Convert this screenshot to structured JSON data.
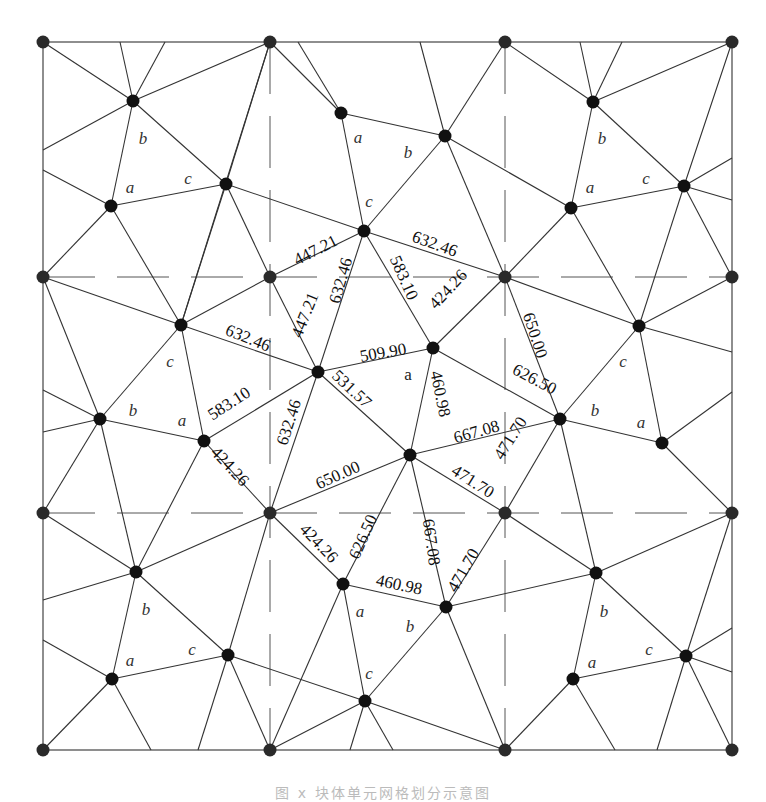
{
  "figure": {
    "caption": "图 x  块体单元网格划分示意图",
    "grid": {
      "xs": [
        43,
        270,
        505,
        732
      ],
      "ys": [
        42,
        277,
        513,
        750
      ]
    },
    "colors": {
      "line": "#333333",
      "node": "#111111",
      "background": "#ffffff"
    }
  },
  "chart_data": {
    "type": "diagram",
    "nodes": [
      {
        "id": "g00",
        "x": 43,
        "y": 42
      },
      {
        "id": "g10",
        "x": 270,
        "y": 42
      },
      {
        "id": "g20",
        "x": 505,
        "y": 42
      },
      {
        "id": "g30",
        "x": 732,
        "y": 42
      },
      {
        "id": "g01",
        "x": 43,
        "y": 277
      },
      {
        "id": "g11",
        "x": 270,
        "y": 277
      },
      {
        "id": "g21",
        "x": 505,
        "y": 277
      },
      {
        "id": "g31",
        "x": 732,
        "y": 277
      },
      {
        "id": "g02",
        "x": 43,
        "y": 513
      },
      {
        "id": "g12",
        "x": 270,
        "y": 513
      },
      {
        "id": "g22",
        "x": 505,
        "y": 513
      },
      {
        "id": "g32",
        "x": 732,
        "y": 513
      },
      {
        "id": "g03",
        "x": 43,
        "y": 750
      },
      {
        "id": "g13",
        "x": 270,
        "y": 750
      },
      {
        "id": "g23",
        "x": 505,
        "y": 750
      },
      {
        "id": "g33",
        "x": 732,
        "y": 750
      },
      {
        "id": "A1",
        "x": 133,
        "y": 101
      },
      {
        "id": "A2",
        "x": 111,
        "y": 206
      },
      {
        "id": "A3",
        "x": 226,
        "y": 184
      },
      {
        "id": "B1",
        "x": 341,
        "y": 113
      },
      {
        "id": "B2",
        "x": 445,
        "y": 136
      },
      {
        "id": "B3",
        "x": 364,
        "y": 231
      },
      {
        "id": "C1",
        "x": 593,
        "y": 102
      },
      {
        "id": "C2",
        "x": 571,
        "y": 208
      },
      {
        "id": "C3",
        "x": 684,
        "y": 186
      },
      {
        "id": "D1",
        "x": 181,
        "y": 325
      },
      {
        "id": "D2",
        "x": 100,
        "y": 419
      },
      {
        "id": "D3",
        "x": 204,
        "y": 441
      },
      {
        "id": "E",
        "x": 318,
        "y": 372
      },
      {
        "id": "F",
        "x": 433,
        "y": 348
      },
      {
        "id": "G",
        "x": 410,
        "y": 455
      },
      {
        "id": "H1",
        "x": 639,
        "y": 326
      },
      {
        "id": "H2",
        "x": 560,
        "y": 419
      },
      {
        "id": "H3",
        "x": 662,
        "y": 443
      },
      {
        "id": "I1",
        "x": 136,
        "y": 572
      },
      {
        "id": "I2",
        "x": 112,
        "y": 679
      },
      {
        "id": "I3",
        "x": 228,
        "y": 655
      },
      {
        "id": "J1",
        "x": 343,
        "y": 584
      },
      {
        "id": "J2",
        "x": 446,
        "y": 607
      },
      {
        "id": "J3",
        "x": 365,
        "y": 701
      },
      {
        "id": "K1",
        "x": 596,
        "y": 573
      },
      {
        "id": "K2",
        "x": 573,
        "y": 679
      },
      {
        "id": "K3",
        "x": 686,
        "y": 656
      }
    ],
    "edges": [
      [
        "g00",
        "A1"
      ],
      [
        "A1",
        "g10"
      ],
      [
        "A1",
        "A2"
      ],
      [
        "A1",
        "A3"
      ],
      [
        "A1",
        [
          43,
          150
        ]
      ],
      [
        "A1",
        [
          120,
          42
        ]
      ],
      [
        "A1",
        [
          165,
          42
        ]
      ],
      [
        "A2",
        "A3"
      ],
      [
        "A2",
        [
          43,
          170
        ]
      ],
      [
        "A2",
        "g01"
      ],
      [
        "A2",
        "D1"
      ],
      [
        "A3",
        "g10"
      ],
      [
        "A3",
        "B3"
      ],
      [
        "A3",
        "D1"
      ],
      [
        "A3",
        "g11"
      ],
      [
        "g10",
        "B1"
      ],
      [
        "g10",
        "D1"
      ],
      [
        "B1",
        "B2"
      ],
      [
        "B1",
        "B3"
      ],
      [
        "B1",
        [
          298,
          42
        ]
      ],
      [
        "B2",
        [
          420,
          42
        ]
      ],
      [
        "B2",
        "g20"
      ],
      [
        "B2",
        "B3"
      ],
      [
        "B2",
        "C2"
      ],
      [
        "B2",
        "g21"
      ],
      [
        "B3",
        "g11"
      ],
      [
        "B3",
        "g21"
      ],
      [
        "B3",
        "F"
      ],
      [
        "B3",
        "E"
      ],
      [
        "g20",
        "C1"
      ],
      [
        "C1",
        "g30"
      ],
      [
        "C1",
        "C2"
      ],
      [
        "C1",
        "C3"
      ],
      [
        "C1",
        [
          580,
          42
        ]
      ],
      [
        "C1",
        [
          622,
          42
        ]
      ],
      [
        "C2",
        "C3"
      ],
      [
        "C2",
        "g21"
      ],
      [
        "C2",
        "H1"
      ],
      [
        "C3",
        "g30"
      ],
      [
        "C3",
        [
          732,
          158
        ]
      ],
      [
        "C3",
        [
          732,
          200
        ]
      ],
      [
        "C3",
        "g31"
      ],
      [
        "C3",
        "H1"
      ],
      [
        "g01",
        "D1"
      ],
      [
        "g01",
        "D2"
      ],
      [
        "D1",
        "D2"
      ],
      [
        "D1",
        "g11"
      ],
      [
        "D1",
        "E"
      ],
      [
        "D1",
        "D3"
      ],
      [
        "D2",
        [
          43,
          390
        ]
      ],
      [
        "D2",
        [
          43,
          432
        ]
      ],
      [
        "D2",
        "D3"
      ],
      [
        "D2",
        "g02"
      ],
      [
        "D2",
        "I1"
      ],
      [
        "D3",
        "E"
      ],
      [
        "D3",
        "g12"
      ],
      [
        "D3",
        "I1"
      ],
      [
        "g11",
        "E"
      ],
      [
        "E",
        "F"
      ],
      [
        "E",
        "G"
      ],
      [
        "E",
        "g12"
      ],
      [
        "F",
        "g21"
      ],
      [
        "F",
        "G"
      ],
      [
        "F",
        "H2"
      ],
      [
        "G",
        "H2"
      ],
      [
        "G",
        "g12"
      ],
      [
        "G",
        "J1"
      ],
      [
        "G",
        "J2"
      ],
      [
        "G",
        "g22"
      ],
      [
        "g21",
        "H2"
      ],
      [
        "g21",
        "H1"
      ],
      [
        "g31",
        "H1"
      ],
      [
        "H1",
        "H2"
      ],
      [
        "H1",
        "H3"
      ],
      [
        "H1",
        [
          732,
          352
        ]
      ],
      [
        "H2",
        "H3"
      ],
      [
        "H2",
        "g22"
      ],
      [
        "H2",
        "K1"
      ],
      [
        "H3",
        [
          732,
          392
        ]
      ],
      [
        "H3",
        "g32"
      ],
      [
        "g02",
        "I1"
      ],
      [
        "I1",
        "I2"
      ],
      [
        "I1",
        "I3"
      ],
      [
        "I1",
        "g12"
      ],
      [
        "I1",
        [
          43,
          600
        ]
      ],
      [
        "I2",
        [
          43,
          640
        ]
      ],
      [
        "I2",
        "I3"
      ],
      [
        "I2",
        "g03"
      ],
      [
        "I2",
        [
          151,
          750
        ]
      ],
      [
        "I3",
        "g12"
      ],
      [
        "I3",
        "J3"
      ],
      [
        "I3",
        "g13"
      ],
      [
        "I3",
        [
          198,
          750
        ]
      ],
      [
        "g12",
        "J1"
      ],
      [
        "J1",
        "J2"
      ],
      [
        "J1",
        "J3"
      ],
      [
        "J1",
        "g13"
      ],
      [
        "J2",
        "g22"
      ],
      [
        "J2",
        "K1"
      ],
      [
        "J2",
        "J3"
      ],
      [
        "J2",
        "g23"
      ],
      [
        "J3",
        "g13"
      ],
      [
        "J3",
        "g23"
      ],
      [
        "J3",
        [
          350,
          750
        ]
      ],
      [
        "J3",
        [
          393,
          750
        ]
      ],
      [
        "g22",
        "K1"
      ],
      [
        "K1",
        "g32"
      ],
      [
        "K1",
        "K2"
      ],
      [
        "K1",
        "K3"
      ],
      [
        "K2",
        "K3"
      ],
      [
        "K2",
        "g23"
      ],
      [
        "K2",
        [
          615,
          750
        ]
      ],
      [
        "K3",
        "g32"
      ],
      [
        "K3",
        [
          732,
          628
        ]
      ],
      [
        "K3",
        [
          732,
          672
        ]
      ],
      [
        "K3",
        "g33"
      ],
      [
        "K3",
        [
          657,
          750
        ]
      ]
    ],
    "edge_length_labels": [
      {
        "text": "447.21",
        "x": 318,
        "y": 255,
        "angle": -27
      },
      {
        "text": "632.46",
        "x": 433,
        "y": 249,
        "angle": 20
      },
      {
        "text": "583.10",
        "x": 399,
        "y": 280,
        "angle": 66
      },
      {
        "text": "424.26",
        "x": 452,
        "y": 293,
        "angle": -47
      },
      {
        "text": "650.00",
        "x": 530,
        "y": 337,
        "angle": 72
      },
      {
        "text": "632.46",
        "x": 346,
        "y": 282,
        "angle": -74
      },
      {
        "text": "447.21",
        "x": 310,
        "y": 317,
        "angle": -68
      },
      {
        "text": "632.46",
        "x": 246,
        "y": 343,
        "angle": 22
      },
      {
        "text": "509.90",
        "x": 384,
        "y": 358,
        "angle": -10
      },
      {
        "text": "626.50",
        "x": 532,
        "y": 384,
        "angle": 28
      },
      {
        "text": "460.98",
        "x": 435,
        "y": 395,
        "angle": 78
      },
      {
        "text": "531.57",
        "x": 348,
        "y": 393,
        "angle": 43
      },
      {
        "text": "583.10",
        "x": 232,
        "y": 408,
        "angle": -33
      },
      {
        "text": "632.46",
        "x": 294,
        "y": 424,
        "angle": -72
      },
      {
        "text": "424.26",
        "x": 226,
        "y": 470,
        "angle": 47
      },
      {
        "text": "667.08",
        "x": 478,
        "y": 437,
        "angle": -16
      },
      {
        "text": "471.70",
        "x": 515,
        "y": 441,
        "angle": -58
      },
      {
        "text": "650.00",
        "x": 340,
        "y": 480,
        "angle": -24
      },
      {
        "text": "471.70",
        "x": 470,
        "y": 486,
        "angle": 32
      },
      {
        "text": "424.26",
        "x": 315,
        "y": 547,
        "angle": 46
      },
      {
        "text": "626.50",
        "x": 368,
        "y": 539,
        "angle": -66
      },
      {
        "text": "667.08",
        "x": 426,
        "y": 543,
        "angle": 82
      },
      {
        "text": "471.70",
        "x": 468,
        "y": 573,
        "angle": -60
      },
      {
        "text": "460.98",
        "x": 398,
        "y": 590,
        "angle": 12
      }
    ],
    "vertex_labels": [
      {
        "text": "b",
        "x": 143,
        "y": 144,
        "italic": true
      },
      {
        "text": "a",
        "x": 130,
        "y": 193,
        "italic": true
      },
      {
        "text": "c",
        "x": 188,
        "y": 184,
        "italic": true
      },
      {
        "text": "a",
        "x": 358,
        "y": 143,
        "italic": true
      },
      {
        "text": "b",
        "x": 408,
        "y": 158,
        "italic": true
      },
      {
        "text": "c",
        "x": 369,
        "y": 207,
        "italic": true
      },
      {
        "text": "b",
        "x": 602,
        "y": 144,
        "italic": true
      },
      {
        "text": "a",
        "x": 590,
        "y": 193,
        "italic": true
      },
      {
        "text": "c",
        "x": 646,
        "y": 184,
        "italic": true
      },
      {
        "text": "c",
        "x": 170,
        "y": 367,
        "italic": true
      },
      {
        "text": "b",
        "x": 133,
        "y": 416,
        "italic": true
      },
      {
        "text": "a",
        "x": 182,
        "y": 426,
        "italic": true
      },
      {
        "text": "a",
        "x": 408,
        "y": 380,
        "italic": false
      },
      {
        "text": "c",
        "x": 623,
        "y": 367,
        "italic": true
      },
      {
        "text": "b",
        "x": 595,
        "y": 416,
        "italic": true
      },
      {
        "text": "a",
        "x": 641,
        "y": 428,
        "italic": true
      },
      {
        "text": "b",
        "x": 146,
        "y": 615,
        "italic": true
      },
      {
        "text": "a",
        "x": 130,
        "y": 666,
        "italic": true
      },
      {
        "text": "c",
        "x": 192,
        "y": 655,
        "italic": true
      },
      {
        "text": "a",
        "x": 360,
        "y": 617,
        "italic": true
      },
      {
        "text": "b",
        "x": 410,
        "y": 632,
        "italic": true
      },
      {
        "text": "c",
        "x": 369,
        "y": 679,
        "italic": true
      },
      {
        "text": "b",
        "x": 604,
        "y": 617,
        "italic": true
      },
      {
        "text": "a",
        "x": 592,
        "y": 668,
        "italic": true
      },
      {
        "text": "c",
        "x": 649,
        "y": 655,
        "italic": true
      }
    ]
  }
}
